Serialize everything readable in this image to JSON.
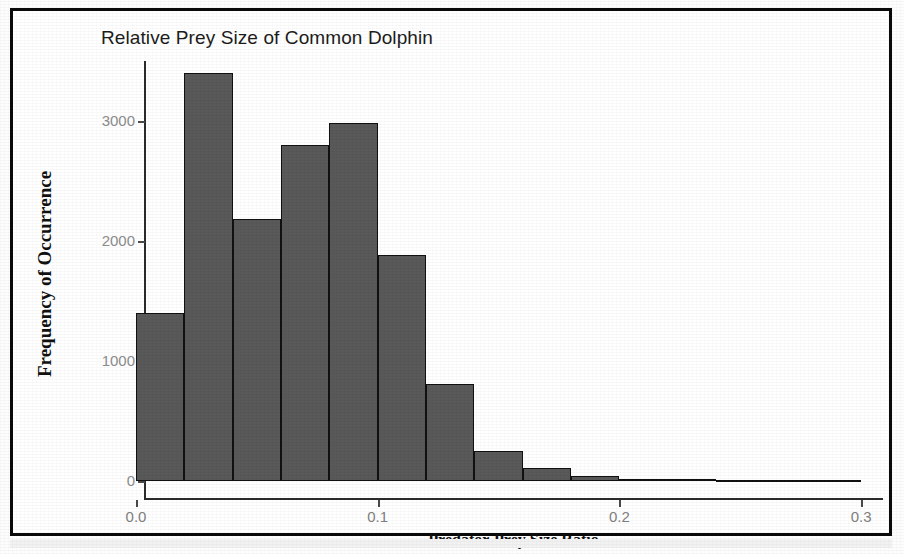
{
  "chart_data": {
    "type": "bar",
    "title": "Relative Prey Size of Common Dolphin",
    "xlabel": "Predator-Prey Size Ratio",
    "ylabel": "Frequency of Occurrence",
    "grid": false,
    "legend": false,
    "legend_position": "none",
    "xlim": [
      -0.008,
      0.31
    ],
    "ylim": [
      0,
      3560
    ],
    "xticks": [
      0.0,
      0.1,
      0.2,
      0.3
    ],
    "xtick_labels": [
      "0.0",
      "0.1",
      "0.2",
      "0.3"
    ],
    "yticks": [
      0,
      1000,
      2000,
      3000
    ],
    "ytick_labels": [
      "0",
      "1000",
      "2000",
      "3000"
    ],
    "bin_width": 0.02,
    "bar_color": "#595959",
    "bar_edge_color": "#111111",
    "axis_color": "#2b2b2b",
    "tick_label_color": "#8a8a8a",
    "bins": [
      {
        "x0": 0.0,
        "x1": 0.02,
        "value": 1400
      },
      {
        "x0": 0.02,
        "x1": 0.04,
        "value": 3400
      },
      {
        "x0": 0.04,
        "x1": 0.06,
        "value": 2180
      },
      {
        "x0": 0.06,
        "x1": 0.08,
        "value": 2800
      },
      {
        "x0": 0.08,
        "x1": 0.1,
        "value": 2980
      },
      {
        "x0": 0.1,
        "x1": 0.12,
        "value": 1880
      },
      {
        "x0": 0.12,
        "x1": 0.14,
        "value": 810
      },
      {
        "x0": 0.14,
        "x1": 0.16,
        "value": 250
      },
      {
        "x0": 0.16,
        "x1": 0.18,
        "value": 110
      },
      {
        "x0": 0.18,
        "x1": 0.2,
        "value": 40
      },
      {
        "x0": 0.2,
        "x1": 0.22,
        "value": 18
      },
      {
        "x0": 0.22,
        "x1": 0.24,
        "value": 14
      },
      {
        "x0": 0.24,
        "x1": 0.26,
        "value": 12
      },
      {
        "x0": 0.26,
        "x1": 0.28,
        "value": 5
      },
      {
        "x0": 0.28,
        "x1": 0.3,
        "value": 5
      }
    ],
    "categories": [
      "0.00-0.02",
      "0.02-0.04",
      "0.04-0.06",
      "0.06-0.08",
      "0.08-0.10",
      "0.10-0.12",
      "0.12-0.14",
      "0.14-0.16",
      "0.16-0.18",
      "0.18-0.20",
      "0.20-0.22",
      "0.22-0.24",
      "0.24-0.26",
      "0.26-0.28",
      "0.28-0.30"
    ],
    "values": [
      1400,
      3400,
      2180,
      2800,
      2980,
      1880,
      810,
      250,
      110,
      40,
      18,
      14,
      12,
      5,
      5
    ]
  }
}
